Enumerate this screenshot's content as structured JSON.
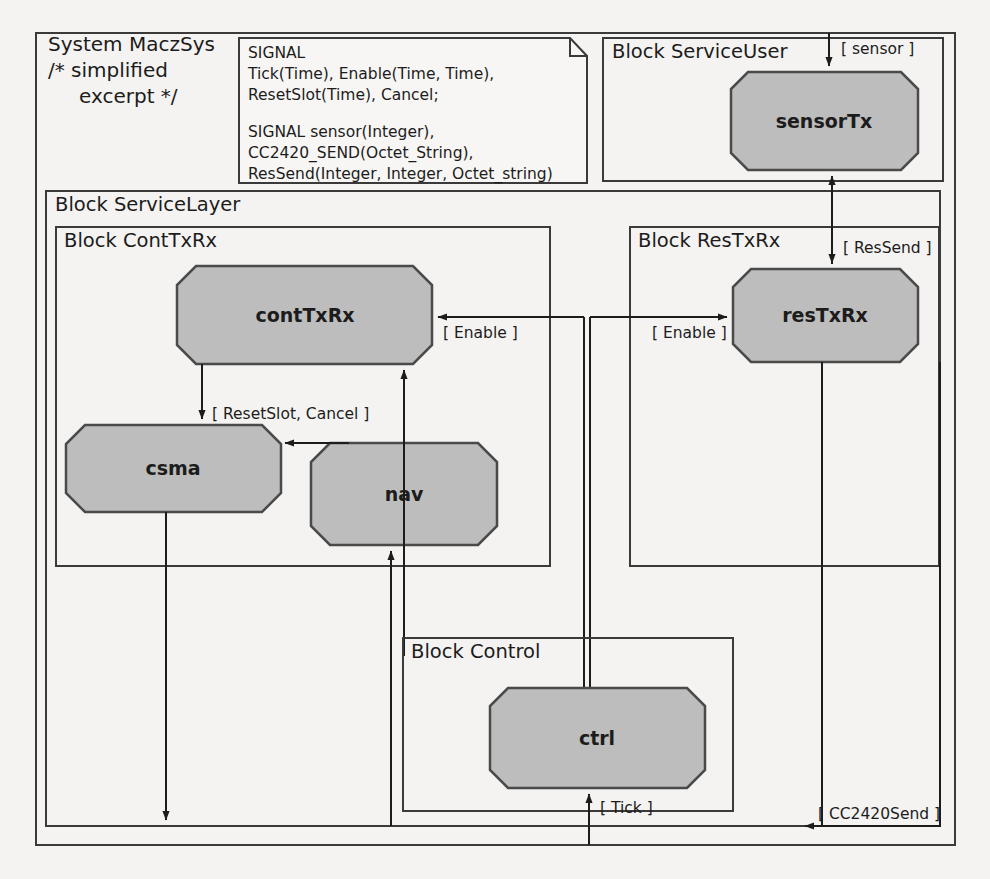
{
  "diagram": {
    "type": "sdl-block-diagram",
    "system": {
      "title_line1": "System MaczSys",
      "title_line2": "/* simplified",
      "title_line3": "excerpt */"
    },
    "note": {
      "name": "signal-declaration-note",
      "lines": [
        "SIGNAL",
        "  Tick(Time), Enable(Time, Time),",
        "  ResetSlot(Time), Cancel;",
        "",
        "SIGNAL      sensor(Integer),",
        "  CC2420_SEND(Octet_String),",
        "  ResSend(Integer, Integer, Octet_string)"
      ]
    },
    "blocks": [
      {
        "id": "serviceuser",
        "label": "Block ServiceUser"
      },
      {
        "id": "servicelayer",
        "label": "Block ServiceLayer"
      },
      {
        "id": "conttxrx",
        "label": "Block ContTxRx"
      },
      {
        "id": "restxrx",
        "label": "Block ResTxRx"
      },
      {
        "id": "control",
        "label": "Block Control"
      }
    ],
    "processes": [
      {
        "id": "sensorTx",
        "label": "sensorTx"
      },
      {
        "id": "contTxRx",
        "label": "contTxRx"
      },
      {
        "id": "csma",
        "label": "csma"
      },
      {
        "id": "nav",
        "label": "nav"
      },
      {
        "id": "resTxRx",
        "label": "resTxRx"
      },
      {
        "id": "ctrl",
        "label": "ctrl"
      }
    ],
    "signal_labels": [
      {
        "id": "sensor",
        "text": "[ sensor ]"
      },
      {
        "id": "ressend",
        "text": "[ ResSend ]"
      },
      {
        "id": "enable-cont",
        "text": "[ Enable ]"
      },
      {
        "id": "enable-res",
        "text": "[ Enable ]"
      },
      {
        "id": "resetslot-cancel",
        "text": "[ ResetSlot, Cancel ]"
      },
      {
        "id": "tick",
        "text": "[ Tick ]"
      },
      {
        "id": "cc2420send",
        "text": "[ CC2420Send ]"
      }
    ],
    "colors": {
      "process_fill": "#bdbdbd",
      "stroke": "#3a3a3a",
      "background": "#f4f3f1",
      "text": "#1c1c1c"
    }
  }
}
